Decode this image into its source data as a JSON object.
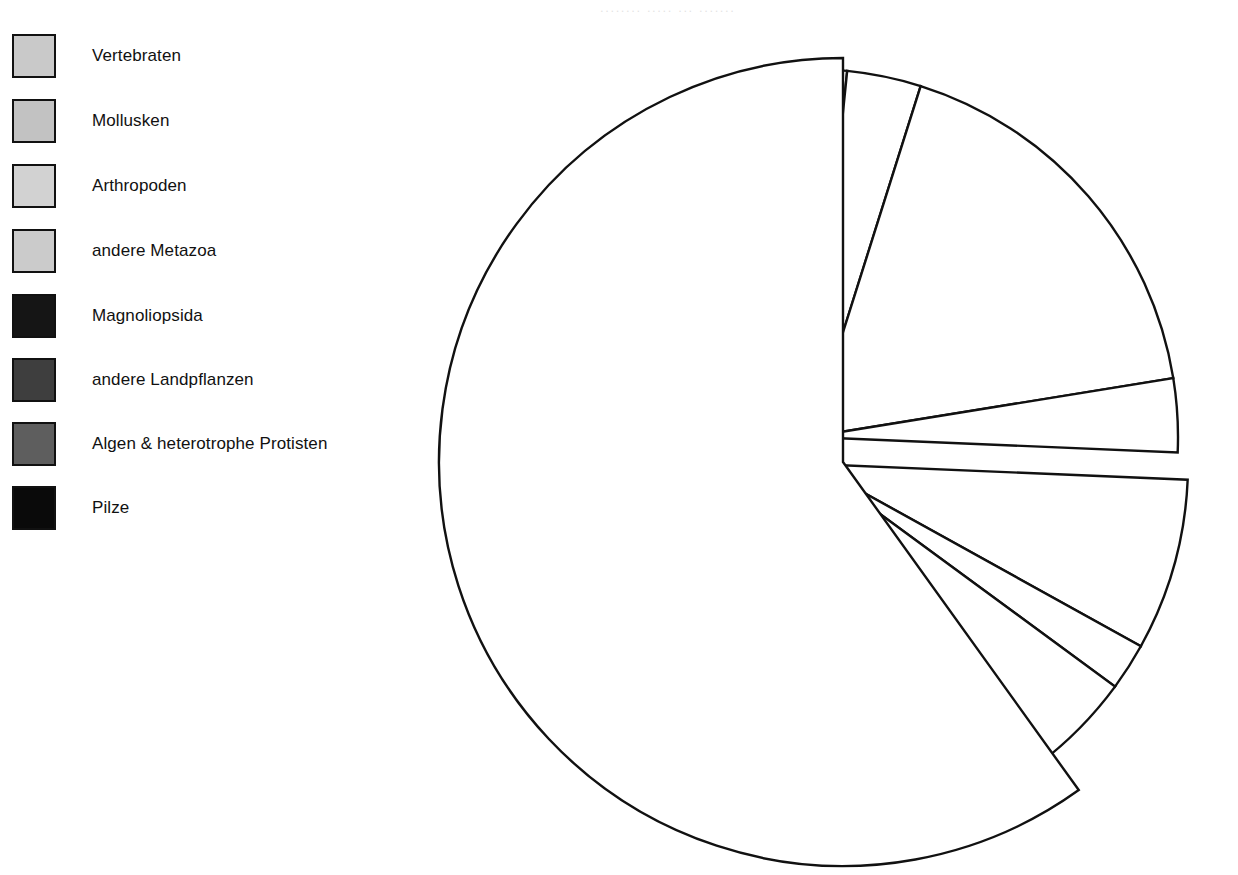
{
  "chart_data": {
    "type": "pie",
    "title": "",
    "subtitle": "",
    "xlabel": "",
    "ylabel": "",
    "legend_position": "left",
    "grid": false,
    "style": {
      "fill": "#ffffff",
      "stroke": "#111111",
      "stroke_width": 2.4,
      "exploded": true,
      "background": "#ffffff"
    },
    "geometry": {
      "main_center_x": 843,
      "main_center_y": 462,
      "radius": 404,
      "small_group_upper_apex_x": 810,
      "small_group_upper_apex_y": 437,
      "small_group_lower_apex_x": 812,
      "small_group_lower_apex_y": 464,
      "start_angle_deg": -90
    },
    "categories": [
      "Vertebraten",
      "Mollusken",
      "Arthropoden",
      "andere Metazoa",
      "Magnoliopsida",
      "andere Landpflanzen",
      "Algen & heterotrophe Protisten",
      "Pilze"
    ],
    "values": [
      1.6,
      3.2,
      17.6,
      3.2,
      7.4,
      2.0,
      5.0,
      60.0
    ],
    "unit": "%",
    "swatch_colors": [
      "#c9c9c9",
      "#c2c2c2",
      "#d2d2d2",
      "#cbcbcb",
      "#151515",
      "#3e3e3e",
      "#5e5e5e",
      "#0a0a0a"
    ],
    "slice_angles_deg": [
      {
        "name": "Vertebraten",
        "start": -90.0,
        "end": -84.2,
        "sweep": 5.8
      },
      {
        "name": "Mollusken",
        "start": -84.2,
        "end": -72.5,
        "sweep": 11.7
      },
      {
        "name": "Arthropoden",
        "start": -72.5,
        "end": -9.2,
        "sweep": 63.3
      },
      {
        "name": "andere Metazoa",
        "start": -9.2,
        "end": 2.4,
        "sweep": 11.6
      },
      {
        "name": "Magnoliopsida",
        "start": 2.4,
        "end": 29.0,
        "sweep": 26.6
      },
      {
        "name": "andere Landpflanzen",
        "start": 29.0,
        "end": 36.3,
        "sweep": 7.3
      },
      {
        "name": "Algen & heterotrophe Protisten",
        "start": 36.3,
        "end": 54.3,
        "sweep": 18.0
      },
      {
        "name": "Pilze",
        "start": 54.3,
        "end": 270.0,
        "sweep": 215.7
      }
    ]
  },
  "legend": {
    "items": [
      {
        "label": "Vertebraten",
        "color": "#c9c9c9",
        "top": 33
      },
      {
        "label": "Mollusken",
        "color": "#c2c2c2",
        "top": 98
      },
      {
        "label": "Arthropoden",
        "color": "#d2d2d2",
        "top": 163
      },
      {
        "label": "andere Metazoa",
        "color": "#cbcbcb",
        "top": 228
      },
      {
        "label": "Magnoliopsida",
        "color": "#151515",
        "top": 293
      },
      {
        "label": "andere Landpflanzen",
        "color": "#3e3e3e",
        "top": 357
      },
      {
        "label": "Algen & heterotrophe Protisten",
        "color": "#5e5e5e",
        "top": 421
      },
      {
        "label": "Pilze",
        "color": "#0a0a0a",
        "top": 485
      }
    ]
  },
  "artifacts": {
    "top_cropped_text": "........ ..... ... ......."
  }
}
